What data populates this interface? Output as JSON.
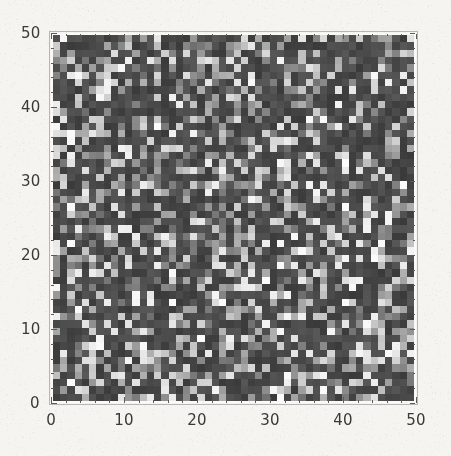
{
  "figure": {
    "background_color": "#f6f4f1",
    "frame_color": "#fbfaf8",
    "label_color": "#3b3936",
    "tick_color": "#5d5a57"
  },
  "chart_data": {
    "type": "heatmap",
    "title": "",
    "subtitle": "",
    "xlabel": "",
    "ylabel": "",
    "rows": 50,
    "cols": 50,
    "xlim": [
      0,
      50
    ],
    "ylim": [
      0,
      50
    ],
    "grid": false,
    "legend": "none",
    "colormap": "grayscale",
    "colormap_min_color": "#3f3f3f",
    "colormap_max_color": "#ececec",
    "value_range": [
      0,
      1
    ],
    "x_ticks": [
      0,
      10,
      20,
      30,
      40,
      50
    ],
    "x_tick_labels": [
      "0",
      "10",
      "20",
      "30",
      "40",
      "50"
    ],
    "x_minor_tick_step": 2,
    "y_ticks": [
      0,
      10,
      20,
      30,
      40,
      50
    ],
    "y_tick_labels": [
      "0",
      "10",
      "20",
      "30",
      "40",
      "50"
    ],
    "y_minor_tick_step": 2,
    "random_seed": 20240517,
    "noise_distribution": "uniform-with-sparse-bright-spikes",
    "bright_fraction": 0.18,
    "mid_fraction": 0.22
  },
  "axes": {
    "x_labels": [
      "0",
      "10",
      "20",
      "30",
      "40",
      "50"
    ],
    "y_labels": [
      "0",
      "10",
      "20",
      "30",
      "40",
      "50"
    ]
  }
}
